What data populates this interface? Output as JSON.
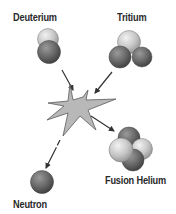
{
  "diagram": {
    "labels": {
      "deuterium": "Deuterium",
      "tritium": "Tritium",
      "fusion_helium": "Fusion Helium",
      "neutron": "Neutron"
    },
    "colors": {
      "proton_light": "#c9c9c9",
      "neutron_dark": "#6b6b6b",
      "star_fill": "#b5b5b5",
      "star_stroke": "#555555",
      "arrow": "#333333",
      "text": "#2a2a2a"
    },
    "reactants": [
      "Deuterium",
      "Tritium"
    ],
    "products": [
      "Fusion Helium",
      "Neutron"
    ]
  }
}
